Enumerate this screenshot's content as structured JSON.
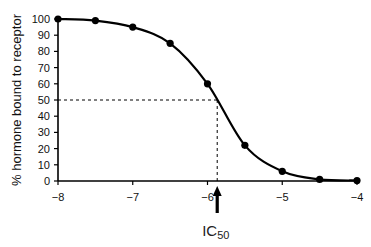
{
  "chart_data": {
    "type": "line",
    "title": "",
    "xlabel": "",
    "ylabel": "% hormone bound to receptor",
    "xlim": [
      -8,
      -4
    ],
    "ylim": [
      0,
      100
    ],
    "x_ticks": [
      -8,
      -7,
      -6,
      -5,
      -4
    ],
    "x_tick_labels": [
      "−8",
      "−7",
      "−6",
      "−5",
      "−4"
    ],
    "y_ticks": [
      0,
      10,
      20,
      30,
      40,
      50,
      60,
      70,
      80,
      90,
      100
    ],
    "y_tick_labels": [
      "0",
      "10",
      "20",
      "30",
      "40",
      "50",
      "60",
      "70",
      "80",
      "90",
      "100"
    ],
    "grid": false,
    "legend": null,
    "series": [
      {
        "name": "binding curve",
        "x": [
          -8,
          -7.5,
          -7,
          -6.5,
          -6,
          -5.5,
          -5,
          -4.5,
          -4
        ],
        "y": [
          100,
          99,
          95,
          85,
          60,
          22,
          6,
          1,
          0.3
        ]
      }
    ],
    "annotations": [
      {
        "type": "dashed-line",
        "from": [
          -8,
          50
        ],
        "to": [
          -5.87,
          50
        ]
      },
      {
        "type": "dashed-line",
        "from": [
          -5.87,
          50
        ],
        "to": [
          -5.87,
          0
        ]
      },
      {
        "type": "arrow",
        "x": -5.87,
        "label": "IC",
        "subscript": "50"
      }
    ]
  },
  "labels": {
    "ylabel": "% hormone bound to receptor",
    "ic50_main": "IC",
    "ic50_sub": "50",
    "x_ticks": [
      "−8",
      "−7",
      "−6",
      "−5",
      "−4"
    ],
    "y_ticks": [
      "0",
      "10",
      "20",
      "30",
      "40",
      "50",
      "60",
      "70",
      "80",
      "90",
      "100"
    ]
  }
}
